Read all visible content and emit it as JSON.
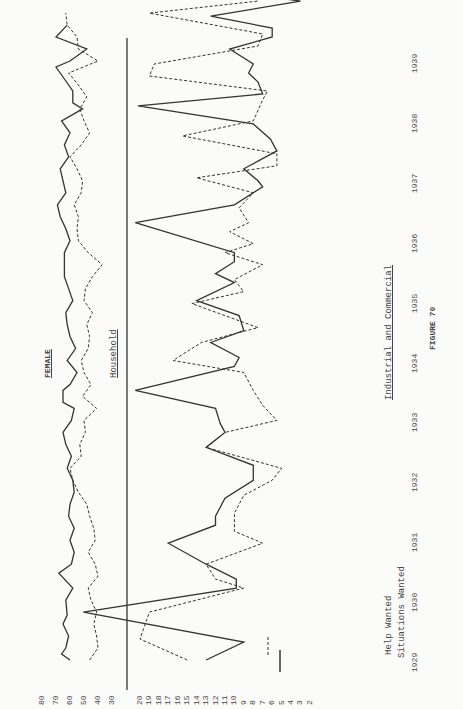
{
  "chart_data": [
    {
      "type": "line",
      "title": "FEMALE",
      "subtitle": "Household",
      "orientation": "rotated-90-ccw",
      "xlabel": "Year",
      "x_ticks": [
        "1929",
        "1930",
        "1931",
        "1932",
        "1933",
        "1934",
        "1935",
        "1936",
        "1937",
        "1938",
        "1939"
      ],
      "y_ticks": [
        80,
        70,
        60,
        50,
        40,
        30
      ],
      "ylim": [
        30,
        80
      ],
      "series": [
        {
          "name": "Situations Wanted",
          "style": "solid",
          "points": [
            [
              1929.0,
              60
            ],
            [
              1929.1,
              66
            ],
            [
              1929.2,
              63
            ],
            [
              1929.4,
              61
            ],
            [
              1929.6,
              65
            ],
            [
              1929.75,
              62
            ],
            [
              1930.0,
              63
            ],
            [
              1930.2,
              58
            ],
            [
              1930.45,
              68
            ],
            [
              1930.6,
              59
            ],
            [
              1930.8,
              57
            ],
            [
              1931.0,
              60
            ],
            [
              1931.2,
              57
            ],
            [
              1931.4,
              61
            ],
            [
              1931.6,
              60
            ],
            [
              1931.8,
              57
            ],
            [
              1932.0,
              58
            ],
            [
              1932.2,
              62
            ],
            [
              1932.4,
              59
            ],
            [
              1932.6,
              63
            ],
            [
              1932.8,
              65
            ],
            [
              1933.0,
              59
            ],
            [
              1933.2,
              57
            ],
            [
              1933.3,
              65
            ],
            [
              1933.5,
              65
            ],
            [
              1933.6,
              60
            ],
            [
              1933.8,
              55
            ],
            [
              1934.0,
              62
            ],
            [
              1934.2,
              56
            ],
            [
              1934.4,
              60
            ],
            [
              1934.6,
              62
            ],
            [
              1934.8,
              63
            ],
            [
              1935.0,
              58
            ],
            [
              1935.2,
              61
            ],
            [
              1935.4,
              64
            ],
            [
              1935.6,
              64
            ],
            [
              1935.8,
              64
            ],
            [
              1936.0,
              60
            ],
            [
              1936.2,
              63
            ],
            [
              1936.4,
              67
            ],
            [
              1936.6,
              69
            ],
            [
              1936.8,
              63
            ],
            [
              1937.0,
              65
            ],
            [
              1937.2,
              67
            ],
            [
              1937.4,
              61
            ],
            [
              1937.6,
              64
            ],
            [
              1937.8,
              60
            ],
            [
              1938.0,
              66
            ],
            [
              1938.2,
              51
            ],
            [
              1938.3,
              58
            ],
            [
              1938.5,
              58
            ],
            [
              1938.7,
              64
            ],
            [
              1938.9,
              70
            ],
            [
              1939.0,
              60
            ],
            [
              1939.2,
              48
            ],
            [
              1939.4,
              70
            ],
            [
              1939.6,
              62
            ]
          ]
        },
        {
          "name": "Help Wanted",
          "style": "dashed",
          "points": [
            [
              1929.0,
              46
            ],
            [
              1929.2,
              40
            ],
            [
              1929.4,
              41
            ],
            [
              1929.6,
              43
            ],
            [
              1929.8,
              41
            ],
            [
              1930.0,
              45
            ],
            [
              1930.2,
              47
            ],
            [
              1930.4,
              40
            ],
            [
              1930.6,
              42
            ],
            [
              1930.8,
              47
            ],
            [
              1931.0,
              42
            ],
            [
              1931.2,
              43
            ],
            [
              1931.4,
              46
            ],
            [
              1931.6,
              48
            ],
            [
              1931.8,
              54
            ],
            [
              1932.0,
              58
            ],
            [
              1932.2,
              60
            ],
            [
              1932.4,
              52
            ],
            [
              1932.6,
              53
            ],
            [
              1932.8,
              49
            ],
            [
              1933.0,
              50
            ],
            [
              1933.2,
              41
            ],
            [
              1933.4,
              51
            ],
            [
              1933.6,
              45
            ],
            [
              1933.8,
              50
            ],
            [
              1934.0,
              52
            ],
            [
              1934.2,
              47
            ],
            [
              1934.4,
              46
            ],
            [
              1934.6,
              48
            ],
            [
              1934.8,
              44
            ],
            [
              1935.0,
              50
            ],
            [
              1935.2,
              49
            ],
            [
              1935.4,
              44
            ],
            [
              1935.6,
              37
            ],
            [
              1935.8,
              47
            ],
            [
              1936.0,
              54
            ],
            [
              1936.2,
              55
            ],
            [
              1936.4,
              54
            ],
            [
              1936.6,
              57
            ],
            [
              1936.8,
              52
            ],
            [
              1937.0,
              51
            ],
            [
              1937.2,
              55
            ],
            [
              1937.4,
              60
            ],
            [
              1937.6,
              52
            ],
            [
              1937.8,
              46
            ],
            [
              1938.0,
              50
            ],
            [
              1938.2,
              53
            ],
            [
              1938.4,
              48
            ],
            [
              1938.6,
              54
            ],
            [
              1938.8,
              61
            ],
            [
              1939.0,
              40
            ],
            [
              1939.2,
              54
            ],
            [
              1939.4,
              55
            ],
            [
              1939.6,
              62
            ],
            [
              1939.8,
              63
            ]
          ]
        }
      ]
    },
    {
      "type": "line",
      "title": "Industrial and Commercial",
      "orientation": "rotated-90-ccw",
      "xlabel": "Year",
      "x_ticks": [
        "1929",
        "1930",
        "1931",
        "1932",
        "1933",
        "1934",
        "1935",
        "1936",
        "1937",
        "1938",
        "1939"
      ],
      "y_ticks": [
        20,
        19,
        18,
        17,
        16,
        15,
        14,
        13,
        12,
        11,
        10,
        9,
        8,
        7,
        6,
        5,
        4,
        3,
        2
      ],
      "ylim": [
        2,
        20
      ],
      "legend": [
        {
          "label": "Help Wanted",
          "style": "dashed"
        },
        {
          "label": "Situations Wanted",
          "style": "solid"
        }
      ],
      "series": [
        {
          "name": "Situations Wanted",
          "style": "solid",
          "points": [
            [
              1929.0,
              13
            ],
            [
              1929.3,
              9
            ],
            [
              1929.8,
              26
            ],
            [
              1930.2,
              9.8
            ],
            [
              1930.35,
              9.8
            ],
            [
              1930.6,
              13
            ],
            [
              1930.95,
              17
            ],
            [
              1931.25,
              12
            ],
            [
              1931.4,
              12
            ],
            [
              1931.7,
              11
            ],
            [
              1932.0,
              8
            ],
            [
              1932.25,
              8
            ],
            [
              1932.55,
              13
            ],
            [
              1932.8,
              11
            ],
            [
              1932.95,
              11.5
            ],
            [
              1933.2,
              12
            ],
            [
              1933.5,
              20.5
            ],
            [
              1933.9,
              10
            ],
            [
              1934.05,
              9.5
            ],
            [
              1934.3,
              12.5
            ],
            [
              1934.5,
              9
            ],
            [
              1934.75,
              9.5
            ],
            [
              1935.0,
              14
            ],
            [
              1935.3,
              10
            ],
            [
              1935.45,
              12
            ],
            [
              1935.65,
              10
            ],
            [
              1935.8,
              10
            ],
            [
              1936.3,
              20.5
            ],
            [
              1936.6,
              10
            ],
            [
              1936.9,
              7
            ],
            [
              1937.0,
              7.5
            ],
            [
              1937.2,
              9
            ],
            [
              1937.5,
              5.5
            ],
            [
              1937.7,
              6.2
            ],
            [
              1937.95,
              8
            ],
            [
              1938.25,
              20.2
            ],
            [
              1938.45,
              7
            ],
            [
              1938.65,
              7.5
            ],
            [
              1938.8,
              8.5
            ],
            [
              1938.95,
              8
            ],
            [
              1939.2,
              10.5
            ],
            [
              1939.4,
              6
            ],
            [
              1939.55,
              6
            ],
            [
              1939.75,
              12.5
            ],
            [
              1940.0,
              3
            ],
            [
              1940.2,
              12
            ]
          ]
        },
        {
          "name": "Help Wanted",
          "style": "dashed",
          "points": [
            [
              1929.0,
              15
            ],
            [
              1929.35,
              20
            ],
            [
              1929.8,
              19
            ],
            [
              1930.2,
              9
            ],
            [
              1930.35,
              12
            ],
            [
              1930.6,
              13
            ],
            [
              1930.95,
              7
            ],
            [
              1931.15,
              10
            ],
            [
              1931.45,
              10
            ],
            [
              1931.75,
              9
            ],
            [
              1932.0,
              6
            ],
            [
              1932.2,
              5
            ],
            [
              1932.55,
              13
            ],
            [
              1932.8,
              11
            ],
            [
              1933.0,
              5.5
            ],
            [
              1933.25,
              7
            ],
            [
              1933.5,
              8
            ],
            [
              1933.8,
              9
            ],
            [
              1934.0,
              16.5
            ],
            [
              1934.3,
              13.5
            ],
            [
              1934.55,
              7.5
            ],
            [
              1934.75,
              11
            ],
            [
              1934.95,
              14.5
            ],
            [
              1935.15,
              9
            ],
            [
              1935.35,
              10
            ],
            [
              1935.6,
              7
            ],
            [
              1935.8,
              11
            ],
            [
              1935.95,
              8
            ],
            [
              1936.15,
              10.5
            ],
            [
              1936.3,
              8.5
            ],
            [
              1936.55,
              9.5
            ],
            [
              1936.8,
              8
            ],
            [
              1937.05,
              14
            ],
            [
              1937.25,
              5.5
            ],
            [
              1937.45,
              5.5
            ],
            [
              1937.75,
              15.5
            ],
            [
              1938.0,
              8
            ],
            [
              1938.35,
              7
            ],
            [
              1938.5,
              6.5
            ],
            [
              1938.75,
              19
            ],
            [
              1938.95,
              18.5
            ],
            [
              1939.25,
              7.5
            ],
            [
              1939.45,
              7
            ],
            [
              1939.8,
              19
            ],
            [
              1940.0,
              7.5
            ],
            [
              1940.15,
              8.5
            ]
          ]
        }
      ]
    }
  ],
  "labels": {
    "female": "FEMALE",
    "household": "Household",
    "industrial": "Industrial and Commercial",
    "legend_help": "Help Wanted",
    "legend_situations": "Situations Wanted",
    "figure": "FIGURE 70"
  },
  "axis": {
    "household_ticks": [
      "80",
      "70",
      "60",
      "50",
      "40",
      "30"
    ],
    "industrial_ticks": [
      "20",
      "19",
      "18",
      "17",
      "16",
      "15",
      "14",
      "13",
      "12",
      "11",
      "10",
      "9",
      "8",
      "7",
      "6",
      "5",
      "4",
      "3",
      "2"
    ],
    "years": [
      "1929",
      "1930",
      "1931",
      "1932",
      "1933",
      "1934",
      "1935",
      "1936",
      "1937",
      "1938",
      "1939"
    ]
  },
  "colors": {
    "ink": "#333333",
    "paper": "#fbfbf9"
  }
}
